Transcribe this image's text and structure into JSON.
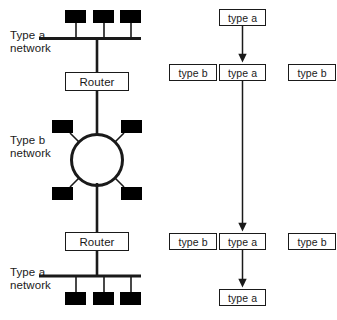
{
  "diagram": {
    "colors": {
      "stroke": "#1a1a1a",
      "node_fill": "#000000",
      "background": "#ffffff"
    }
  },
  "left_panel": {
    "name": "network-topology",
    "labels": {
      "type_a_top": "Type a\nnetwork",
      "type_b_middle": "Type b\nnetwork",
      "type_a_bottom": "Type a\nnetwork"
    },
    "routers": [
      {
        "label": "Router"
      },
      {
        "label": "Router"
      }
    ],
    "segments": [
      {
        "kind": "bus",
        "label": "Type a network",
        "station_count": 3
      },
      {
        "kind": "ring",
        "label": "Type b network",
        "station_count": 4
      },
      {
        "kind": "bus",
        "label": "Type a network",
        "station_count": 3
      }
    ]
  },
  "right_panel": {
    "name": "protocol-stack",
    "boxes": {
      "top": "type a",
      "row1_left": "type b",
      "row1_center": "type a",
      "row1_right": "type b",
      "row2_left": "type b",
      "row2_center": "type a",
      "row2_right": "type b",
      "bottom": "type a"
    },
    "arrows": [
      {
        "from": "top",
        "to": "row1_center"
      },
      {
        "from": "row1_center",
        "to": "row2_center"
      },
      {
        "from": "row2_center",
        "to": "bottom"
      }
    ]
  }
}
